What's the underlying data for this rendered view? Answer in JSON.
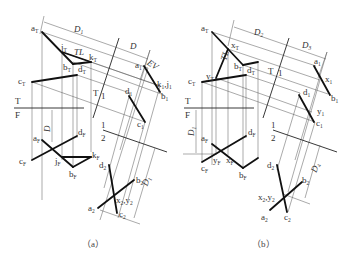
{
  "figure": {
    "panels": [
      {
        "id": "a",
        "caption": "（a）",
        "fold_lines": {
          "tf": {
            "top": "T",
            "bottom": "F"
          },
          "t1": {
            "left": "T",
            "right": "1"
          },
          "12": {
            "top": "1",
            "bottom": "2"
          }
        },
        "dimensions": {
          "d1": "D",
          "d1_sub": "1",
          "d": "D",
          "d_front": "D",
          "d1_view2": "D",
          "d1_view2_sub": "1"
        },
        "annotations": {
          "tl": "TL",
          "ev": "EV"
        },
        "points_top": {
          "a": "a",
          "a_sub": "T",
          "j": "j",
          "j_sub": "T",
          "k": "k",
          "k_sub": "T",
          "b": "b",
          "b_sub": "T",
          "c": "c",
          "c_sub": "T",
          "d": "d",
          "d_sub": "T"
        },
        "points_view1": {
          "a": "a",
          "a_sub": "1",
          "kj": "k",
          "kj_sub": "1",
          "kj2": "j",
          "kj2_sub": "1",
          "b": "b",
          "b_sub": "1",
          "d": "d",
          "d_sub": "1",
          "c": "c",
          "c_sub": "1"
        },
        "points_front": {
          "a": "a",
          "a_sub": "F",
          "d": "d",
          "d_sub": "F",
          "c": "c",
          "c_sub": "F",
          "j": "j",
          "j_sub": "F",
          "k": "k",
          "k_sub": "F",
          "b": "b",
          "b_sub": "F"
        },
        "points_view2": {
          "d": "d",
          "d_sub": "2",
          "b": "b",
          "b_sub": "2",
          "xy": "x",
          "xy_sub": "2",
          "xy2": ",y",
          "xy2_sub": "2",
          "a": "a",
          "a_sub": "2",
          "c": "c",
          "c_sub": "2"
        }
      },
      {
        "id": "b",
        "caption": "（b）",
        "fold_lines": {
          "tf": {
            "top": "T",
            "bottom": "F"
          },
          "t1": {
            "left": "T",
            "right": "1"
          },
          "12": {
            "top": "1",
            "bottom": "2"
          }
        },
        "dimensions": {
          "d2": "D",
          "d2_sub": "2",
          "d3": "D",
          "d3_sub": "3",
          "d1": "D",
          "d1_sub": "1",
          "d4": "D",
          "d4_sub": "4"
        },
        "annotations": {
          "tl": "TL"
        },
        "points_top": {
          "a": "a",
          "a_sub": "T",
          "x": "x",
          "x_sub": "T",
          "b": "b",
          "b_sub": "T",
          "y": "y",
          "y_sub": "T",
          "c": "c",
          "c_sub": "T",
          "d": "d",
          "d_sub": "T"
        },
        "points_view1": {
          "a": "a",
          "a_sub": "1",
          "x": "x",
          "x_sub": "1",
          "b": "b",
          "b_sub": "1",
          "d": "d",
          "d_sub": "1",
          "y": "y",
          "y_sub": "1",
          "c": "c",
          "c_sub": "1"
        },
        "points_front": {
          "a": "a",
          "a_sub": "F",
          "d": "d",
          "d_sub": "F",
          "c": "c",
          "c_sub": "F",
          "y": "y",
          "y_sub": "F",
          "x": "x",
          "x_sub": "F",
          "b": "b",
          "b_sub": "F"
        },
        "points_view2": {
          "d": "d",
          "d_sub": "2",
          "b": "b",
          "b_sub": "2",
          "xy": "x",
          "xy_sub": "2",
          "xy2": ",y",
          "xy2_sub": "2",
          "a": "a",
          "a_sub": "2",
          "c": "c",
          "c_sub": "2"
        }
      }
    ]
  }
}
